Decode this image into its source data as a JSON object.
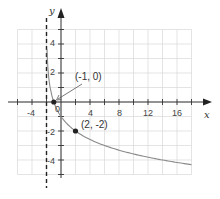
{
  "chart_data": {
    "type": "line",
    "title": "",
    "xlabel": "x",
    "ylabel": "y",
    "function": "y = -log2(x + 2)",
    "xlim": [
      -7,
      18
    ],
    "ylim": [
      -5,
      6
    ],
    "x_ticks": [
      -4,
      4,
      8,
      12,
      16
    ],
    "y_ticks": [
      4,
      2,
      -2,
      -4
    ],
    "origin_label": "0",
    "grid": true,
    "legend": null,
    "asymptote": {
      "x": -2,
      "style": "dashed"
    },
    "series": [
      {
        "name": "f(x)",
        "x": [
          -1.95,
          -1.9,
          -1.8,
          -1.5,
          -1,
          0,
          1,
          2,
          4,
          6,
          8,
          10,
          12,
          14,
          16,
          18
        ],
        "values": [
          4.32,
          3.32,
          2.32,
          1.0,
          0,
          -1.0,
          -1.58,
          -2.0,
          -2.58,
          -3.0,
          -3.32,
          -3.58,
          -3.81,
          -4.0,
          -4.17,
          -4.32
        ]
      }
    ],
    "annotations": [
      {
        "text": "(-1, 0)",
        "x": -1,
        "y": 0,
        "arrow": true
      },
      {
        "text": "(2, -2)",
        "x": 2,
        "y": -2,
        "arrow": false
      }
    ]
  },
  "labels": {
    "x_axis": "x",
    "y_axis": "y",
    "origin": "0",
    "tick_x_m4": "-4",
    "tick_x_4": "4",
    "tick_x_8": "8",
    "tick_x_12": "12",
    "tick_x_16": "16",
    "tick_y_4": "4",
    "tick_y_2": "2",
    "tick_y_m2": "-2",
    "tick_y_m4": "-4",
    "point_a": "(-1, 0)",
    "point_b": "(2, -2)"
  },
  "colors": {
    "grid": "#d8d8d8",
    "axis": "#333333",
    "curve": "#8a8a8a",
    "asymptote": "#222222",
    "point": "#222222"
  }
}
